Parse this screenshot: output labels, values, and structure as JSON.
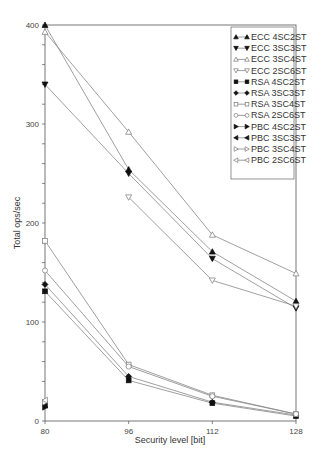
{
  "chart_data": {
    "type": "line",
    "title": "",
    "xlabel": "Security level [bit]",
    "ylabel": "Total ops/sec",
    "x": [
      80,
      96,
      112,
      128
    ],
    "x_ticks": [
      "80",
      "96",
      "112",
      "128"
    ],
    "y_ticks": [
      "0",
      "100",
      "200",
      "300",
      "400"
    ],
    "ylim": [
      0,
      400
    ],
    "grid": false,
    "legend_position": "upper right",
    "series": [
      {
        "name": "ECC 4SC2ST",
        "marker": "triangle-up",
        "filled": true,
        "values": [
          400,
          254,
          171,
          121
        ]
      },
      {
        "name": "ECC 3SC3ST",
        "marker": "triangle-down",
        "filled": true,
        "values": [
          340,
          250,
          164,
          114
        ]
      },
      {
        "name": "ECC 3SC4ST",
        "marker": "triangle-up",
        "filled": false,
        "values": [
          393,
          292,
          188,
          149
        ]
      },
      {
        "name": "ECC 2SC6ST",
        "marker": "triangle-down",
        "filled": false,
        "values": [
          null,
          226,
          142,
          116
        ]
      },
      {
        "name": "RSA 4SC2ST",
        "marker": "square",
        "filled": true,
        "values": [
          131,
          41,
          18,
          5
        ]
      },
      {
        "name": "RSA 3SC3ST",
        "marker": "diamond",
        "filled": true,
        "values": [
          138,
          45,
          19,
          6
        ]
      },
      {
        "name": "RSA 3SC4ST",
        "marker": "square",
        "filled": false,
        "values": [
          182,
          57,
          26,
          7
        ]
      },
      {
        "name": "RSA 2SC6ST",
        "marker": "circle",
        "filled": false,
        "values": [
          152,
          55,
          25,
          7
        ]
      },
      {
        "name": "PBC 4SC2ST",
        "marker": "triangle-right",
        "filled": true,
        "values": [
          14,
          null,
          null,
          null
        ]
      },
      {
        "name": "PBC 3SC3ST",
        "marker": "triangle-left",
        "filled": true,
        "values": [
          16,
          null,
          null,
          null
        ]
      },
      {
        "name": "PBC 3SC4ST",
        "marker": "triangle-right",
        "filled": false,
        "values": [
          19,
          null,
          null,
          null
        ]
      },
      {
        "name": "PBC 2SC6ST",
        "marker": "triangle-left",
        "filled": false,
        "values": [
          21,
          null,
          null,
          null
        ]
      }
    ]
  }
}
